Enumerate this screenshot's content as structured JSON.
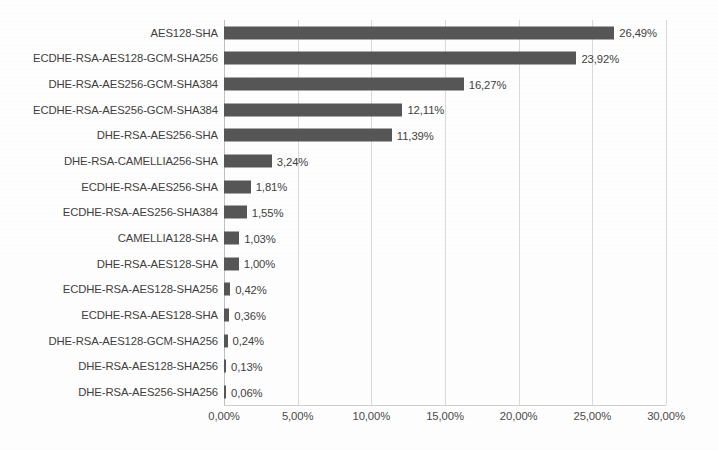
{
  "chart_data": {
    "type": "bar",
    "orientation": "horizontal",
    "title": "",
    "subtitle": "",
    "xlabel": "",
    "ylabel": "",
    "xlim": [
      0,
      30
    ],
    "xtick_values": [
      0,
      5,
      10,
      15,
      20,
      25,
      30
    ],
    "xtick_labels": [
      "0,00%",
      "5,00%",
      "10,00%",
      "15,00%",
      "20,00%",
      "25,00%",
      "30,00%"
    ],
    "grid": true,
    "grid_axis": "x",
    "legend": false,
    "legend_position": "none",
    "value_labels": true,
    "bar_color": "#565656",
    "gridline_color": "#d9d9d9",
    "text_color": "#3f3f3f",
    "categories": [
      "AES128-SHA",
      "ECDHE-RSA-AES128-GCM-SHA256",
      "DHE-RSA-AES256-GCM-SHA384",
      "ECDHE-RSA-AES256-GCM-SHA384",
      "DHE-RSA-AES256-SHA",
      "DHE-RSA-CAMELLIA256-SHA",
      "ECDHE-RSA-AES256-SHA",
      "ECDHE-RSA-AES256-SHA384",
      "CAMELLIA128-SHA",
      "DHE-RSA-AES128-SHA",
      "ECDHE-RSA-AES128-SHA256",
      "ECDHE-RSA-AES128-SHA",
      "DHE-RSA-AES128-GCM-SHA256",
      "DHE-RSA-AES128-SHA256",
      "DHE-RSA-AES256-SHA256"
    ],
    "values": [
      26.49,
      23.92,
      16.27,
      12.11,
      11.39,
      3.24,
      1.81,
      1.55,
      1.03,
      1.0,
      0.42,
      0.36,
      0.24,
      0.13,
      0.06
    ],
    "value_label_texts": [
      "26,49%",
      "23,92%",
      "16,27%",
      "12,11%",
      "11,39%",
      "3,24%",
      "1,81%",
      "1,55%",
      "1,03%",
      "1,00%",
      "0,42%",
      "0,36%",
      "0,24%",
      "0,13%",
      "0,06%"
    ]
  }
}
